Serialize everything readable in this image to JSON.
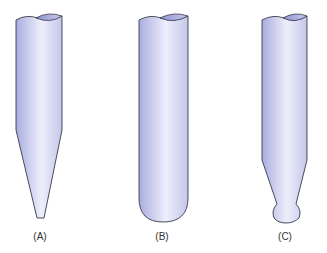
{
  "figure": {
    "tubes": [
      {
        "id": "A",
        "label": "(A)",
        "shape": "conical-tip"
      },
      {
        "id": "B",
        "label": "(B)",
        "shape": "round-bottom"
      },
      {
        "id": "C",
        "label": "(C)",
        "shape": "tapered-bulb-tip"
      }
    ]
  },
  "colors": {
    "tube_fill_dark": "#a9addf",
    "tube_fill_light": "#eeeefb",
    "outline": "#3a3a4a",
    "label": "#333333"
  }
}
